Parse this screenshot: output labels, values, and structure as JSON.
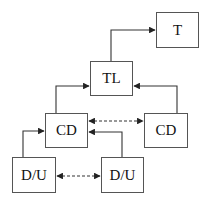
{
  "diagram": {
    "nodes": [
      {
        "id": "t",
        "label": "T"
      },
      {
        "id": "tl",
        "label": "TL"
      },
      {
        "id": "cd_left",
        "label": "CD"
      },
      {
        "id": "cd_right",
        "label": "CD"
      },
      {
        "id": "du_left",
        "label": "D/U"
      },
      {
        "id": "du_right",
        "label": "D/U"
      }
    ],
    "edges": [
      {
        "from": "tl",
        "to": "t",
        "style": "solid"
      },
      {
        "from": "cd_left",
        "to": "tl",
        "style": "solid"
      },
      {
        "from": "cd_right",
        "to": "tl",
        "style": "solid"
      },
      {
        "from": "cd_left",
        "to": "cd_right",
        "style": "dashed",
        "bidirectional": true
      },
      {
        "from": "du_left",
        "to": "cd_left",
        "style": "solid"
      },
      {
        "from": "du_right",
        "to": "cd_left",
        "style": "solid"
      },
      {
        "from": "du_left",
        "to": "du_right",
        "style": "dashed",
        "bidirectional": true
      }
    ],
    "colors": {
      "line": "#333333",
      "border": "#555555"
    }
  }
}
